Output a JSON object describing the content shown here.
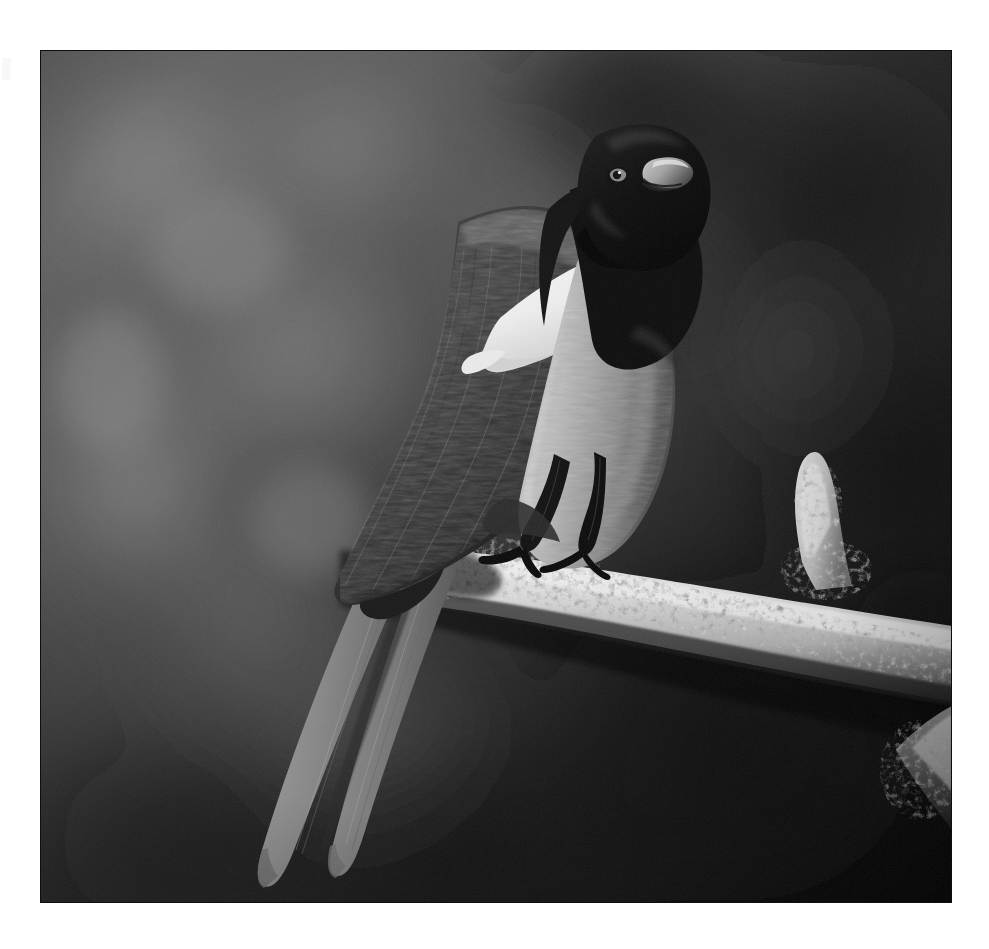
{
  "page": {
    "background_color": "#ffffff",
    "width": 989,
    "height": 949,
    "media_type": "black-and-white photograph",
    "alt_text": "Black-and-white photograph of a black-billed magpie perched on a lichen-covered branch"
  },
  "photo": {
    "frame": {
      "left": 40,
      "top": 50,
      "width": 912,
      "height": 853,
      "border_color": "#1a1a1a"
    },
    "tone": {
      "darkest": "#050505",
      "shadow": "#1c1c1c",
      "background_mid": "#565656",
      "background_light": "#7e7e7e",
      "feather_gray": "#9a9a9a",
      "breast_gray": "#b9b9b9",
      "highlight_white": "#f4f4f4",
      "branch_light": "#ededed",
      "lichen": "#e2e2e2"
    },
    "subject": {
      "species_label": "magpie",
      "head_color": "#0b0b0b",
      "beak_highlight": "#cfcfcf",
      "eye_color": "#e8e8e8",
      "scapular_patch_color": "#fbfbfb",
      "wing_color": "#3a3a3a",
      "tail_color": "#8d8d8d",
      "leg_color": "#141414"
    },
    "branch": {
      "label": "lichen-covered branch",
      "body_color": "#e6e6e6",
      "shadow_color": "#3b3b3b",
      "stub_label": "upward branch stub",
      "secondary_label": "lower-right branch segment"
    },
    "background": {
      "label": "blurred bokeh foliage",
      "top_left_tone": "#6a6a6a",
      "top_right_tone": "#3b3b3b",
      "bottom_left_tone": "#3f3f3f",
      "bottom_right_tone": "#0a0a0a"
    }
  },
  "artifacts": {
    "left_edge_mark_label": "scan edge artifact"
  }
}
